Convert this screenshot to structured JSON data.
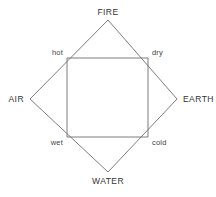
{
  "figure": {
    "background_color": "#ffffff",
    "stroke_color": "#6e6e6e",
    "text_color": "#333333",
    "width": 216,
    "height": 197
  },
  "diamond": {
    "name": "elements-diamond",
    "vertices": [
      {
        "key": "top",
        "x": 108,
        "y": 20
      },
      {
        "key": "right",
        "x": 177,
        "y": 99
      },
      {
        "key": "bottom",
        "x": 108,
        "y": 172
      },
      {
        "key": "left",
        "x": 30,
        "y": 99
      }
    ],
    "points_attr": "108,20 177,99 108,172 30,99"
  },
  "square": {
    "name": "qualities-square",
    "corners": [
      {
        "key": "top-left",
        "x": 67,
        "y": 58
      },
      {
        "key": "top-right",
        "x": 148,
        "y": 58
      },
      {
        "key": "bottom-right",
        "x": 148,
        "y": 137
      },
      {
        "key": "bottom-left",
        "x": 67,
        "y": 137
      }
    ],
    "points_attr": "67,58 148,58 148,137 67,137"
  },
  "elements": {
    "fire": "FIRE",
    "air": "AIR",
    "earth": "EARTH",
    "water": "WATER"
  },
  "qualities": {
    "hot": "hot",
    "dry": "dry",
    "wet": "wet",
    "cold": "cold"
  }
}
